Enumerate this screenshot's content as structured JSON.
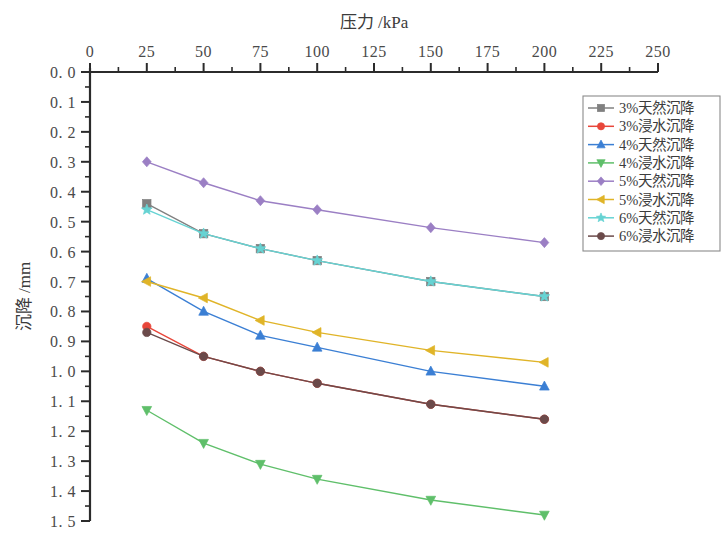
{
  "chart_data": {
    "type": "line",
    "title": "",
    "xlabel": "压力 /kPa",
    "ylabel": "沉降 /mm",
    "xlim": [
      0,
      250
    ],
    "ylim": [
      0,
      1.5
    ],
    "y_inverted": true,
    "x_axis_position": "top",
    "grid": false,
    "legend_position": "right",
    "xticks": [
      "0",
      "25",
      "50",
      "75",
      "100",
      "125",
      "150",
      "175",
      "200",
      "225",
      "250"
    ],
    "xtick_values": [
      0,
      25,
      50,
      75,
      100,
      125,
      150,
      175,
      200,
      225,
      250
    ],
    "yticks": [
      "0. 0",
      "0. 1",
      "0. 2",
      "0. 3",
      "0. 4",
      "0. 5",
      "0. 6",
      "0. 7",
      "0. 8",
      "0. 9",
      "1. 0",
      "1. 1",
      "1. 2",
      "1. 3",
      "1. 4",
      "1. 5"
    ],
    "ytick_values": [
      0.0,
      0.1,
      0.2,
      0.3,
      0.4,
      0.5,
      0.6,
      0.7,
      0.8,
      0.9,
      1.0,
      1.1,
      1.2,
      1.3,
      1.4,
      1.5
    ],
    "x": [
      25,
      50,
      75,
      100,
      150,
      200
    ],
    "series": [
      {
        "name": "3%天然沉降",
        "color": "#808080",
        "marker": "square",
        "values": [
          0.44,
          0.54,
          0.59,
          0.63,
          0.7,
          0.75
        ]
      },
      {
        "name": "3%浸水沉降",
        "color": "#e8463a",
        "marker": "circle",
        "values": [
          0.85,
          0.95,
          1.0,
          1.04,
          1.11,
          1.16
        ]
      },
      {
        "name": "4%天然沉降",
        "color": "#3b7fd4",
        "marker": "triangle-up",
        "values": [
          0.69,
          0.8,
          0.88,
          0.92,
          1.0,
          1.05
        ]
      },
      {
        "name": "4%浸水沉降",
        "color": "#5fbf6a",
        "marker": "triangle-down",
        "values": [
          1.13,
          1.24,
          1.31,
          1.36,
          1.43,
          1.48
        ]
      },
      {
        "name": "5%天然沉降",
        "color": "#9b7fc4",
        "marker": "diamond",
        "values": [
          0.3,
          0.37,
          0.43,
          0.46,
          0.52,
          0.57
        ]
      },
      {
        "name": "5%浸水沉降",
        "color": "#e0b428",
        "marker": "triangle-left",
        "values": [
          0.7,
          0.755,
          0.83,
          0.87,
          0.93,
          0.97
        ]
      },
      {
        "name": "6%天然沉降",
        "color": "#66d3d3",
        "marker": "star",
        "values": [
          0.46,
          0.54,
          0.59,
          0.63,
          0.7,
          0.75
        ]
      },
      {
        "name": "6%浸水沉降",
        "color": "#6b4a4a",
        "marker": "circle",
        "values": [
          0.87,
          0.95,
          1.0,
          1.04,
          1.11,
          1.16
        ]
      }
    ]
  },
  "legend": {
    "items": [
      {
        "label": "3%天然沉降"
      },
      {
        "label": "3%浸水沉降"
      },
      {
        "label": "4%天然沉降"
      },
      {
        "label": "4%浸水沉降"
      },
      {
        "label": "5%天然沉降"
      },
      {
        "label": "5%浸水沉降"
      },
      {
        "label": "6%天然沉降"
      },
      {
        "label": "6%浸水沉降"
      }
    ]
  }
}
